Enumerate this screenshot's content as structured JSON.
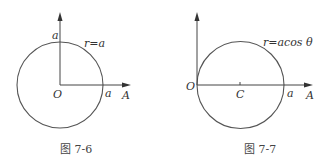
{
  "figures": [
    {
      "id": "fig-7-6",
      "caption": "图 7-6",
      "curve_label": "r=a",
      "origin_label": "O",
      "polar_axis_label": "A",
      "top_intercept_label": "a",
      "right_intercept_label": "a",
      "origin": [
        60,
        85
      ],
      "circle_center": [
        60,
        85
      ],
      "radius": 43
    },
    {
      "id": "fig-7-7",
      "caption": "图 7-7",
      "curve_label": "r=acos θ",
      "origin_label": "O",
      "center_label": "C",
      "polar_axis_label": "A",
      "right_intercept_label": "a",
      "origin": [
        197,
        85
      ],
      "circle_center": [
        240,
        85
      ],
      "radius": 44
    }
  ],
  "colors": {
    "line": "#555555",
    "text": "#333333",
    "background": "#ffffff"
  }
}
